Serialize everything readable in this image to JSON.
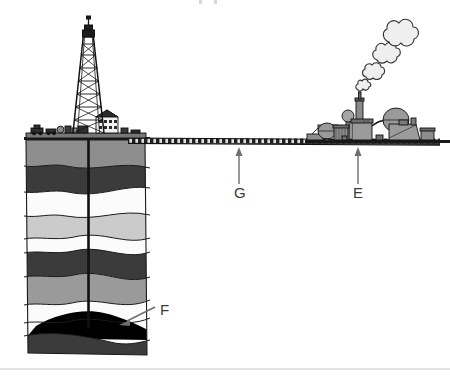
{
  "figure": {
    "background_color": "#ffffff",
    "width": 450,
    "height": 377
  },
  "labels": [
    {
      "id": "label-f",
      "text": "F",
      "refers_to": "oil-reservoir",
      "description": "Black oil reservoir trapped in rock strata at the bottom of the borehole",
      "x": 160,
      "y": 315,
      "arrow": {
        "from_x": 155,
        "from_y": 313,
        "to_x": 118,
        "to_y": 326
      }
    },
    {
      "id": "label-g",
      "text": "G",
      "refers_to": "pipeline",
      "description": "Pipeline carrying crude oil from the well site to the refinery",
      "x": 241,
      "y": 195,
      "arrow": {
        "from_x": 239,
        "from_y": 184,
        "to_x": 239,
        "to_y": 149
      }
    },
    {
      "id": "label-e",
      "text": "E",
      "refers_to": "refinery",
      "description": "Refinery plant with smokestack emitting smoke",
      "x": 360,
      "y": 195,
      "arrow": {
        "from_x": 358,
        "from_y": 184,
        "to_x": 358,
        "to_y": 149
      }
    }
  ],
  "scene": {
    "derrick": {
      "name": "drilling-derrick",
      "description": "Lattice drilling derrick tower with crown block"
    },
    "wellsite_buildings": {
      "name": "wellsite-buildings",
      "description": "Buildings, storage tanks and trucks on the drilling platform"
    },
    "borehole": {
      "name": "borehole",
      "description": "Vertical drill pipe running from the derrick down into the oil reservoir"
    },
    "pipeline": {
      "name": "pipeline",
      "description": "Horizontal hatched pipeline running from the well site to the refinery"
    },
    "refinery": {
      "name": "refinery",
      "description": "Refinery with spherical tanks, distillation columns, smokestack and processing buildings"
    },
    "smoke": {
      "name": "smoke-plume",
      "description": "Cloud-like puffs of smoke rising from the refinery smokestack"
    },
    "bottom_rule": {
      "name": "bottom-divider",
      "description": "Faint horizontal divider line near the bottom edge"
    }
  },
  "strata": [
    {
      "name": "stratum-topsoil",
      "tone": "medium-gray",
      "color": "#8e8e8e"
    },
    {
      "name": "stratum-dark-1",
      "tone": "dark-gray",
      "color": "#3b3b3b"
    },
    {
      "name": "stratum-light-1",
      "tone": "white",
      "color": "#fbfbfb"
    },
    {
      "name": "stratum-lightgray-1",
      "tone": "light-gray",
      "color": "#cbcbcb"
    },
    {
      "name": "stratum-white-1",
      "tone": "white",
      "color": "#fbfbfb"
    },
    {
      "name": "stratum-dark-2",
      "tone": "dark-gray",
      "color": "#3b3b3b"
    },
    {
      "name": "stratum-medium-1",
      "tone": "medium-gray",
      "color": "#9a9a9a"
    },
    {
      "name": "stratum-white-2",
      "tone": "white",
      "color": "#fbfbfb"
    },
    {
      "name": "oil-reservoir",
      "tone": "black",
      "color": "#000000"
    },
    {
      "name": "stratum-dark-3",
      "tone": "dark-gray",
      "color": "#3b3b3b"
    }
  ],
  "colors": {
    "ink": "#1a1a1a",
    "label_text": "#3b3b3b",
    "arrow": "#6e6e6e",
    "smoke_fill": "#eeeeee",
    "smoke_stroke": "#333333",
    "divider": "#e3e3e3"
  }
}
